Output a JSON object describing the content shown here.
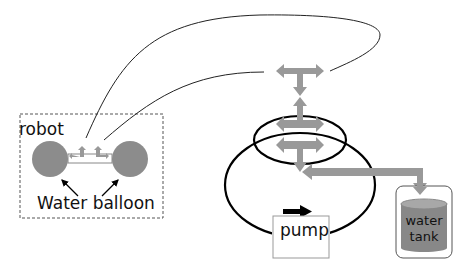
{
  "diagram": {
    "robot_box": {
      "label": "robot"
    },
    "balloons": {
      "label": "Water balloon",
      "count": 2
    },
    "pump": {
      "label": "pump"
    },
    "tank": {
      "label_line1": "water",
      "label_line2": "tank"
    },
    "colors": {
      "valve_fill": "#999999",
      "balloon_fill": "#8c8c8c",
      "tank_fill": "#888888",
      "tank_top": "#a8a8a8",
      "line": "#000000",
      "box_border": "#555555"
    }
  }
}
